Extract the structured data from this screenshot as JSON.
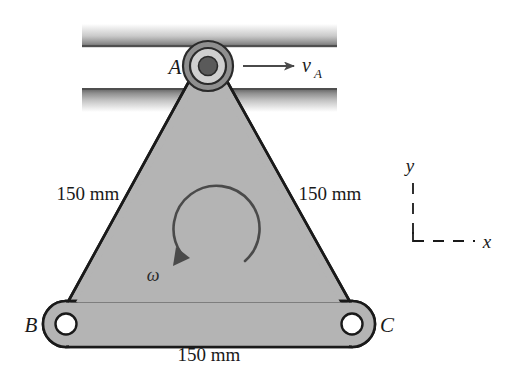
{
  "figure": {
    "points": {
      "a_label": "A",
      "b_label": "B",
      "c_label": "C"
    },
    "velocity": {
      "symbol": "v",
      "subscript": "A",
      "arrow_direction": "right"
    },
    "omega": {
      "symbol": "ω",
      "sense": "counterclockwise"
    },
    "dimensions": {
      "left_side": "150 mm",
      "right_side": "150 mm",
      "bottom_side": "150 mm"
    },
    "axes": {
      "y_label": "y",
      "x_label": "x",
      "style": "dashed"
    },
    "colors": {
      "plate_fill": "#b4b4b4",
      "plate_stroke": "#1a1a1a",
      "rail_dark": "#6e6e6e",
      "rail_light": "#ffffff",
      "pin_ring": "#a8a8a8",
      "pin_core": "#5a5a5a",
      "pin_hole": "#ffffff",
      "text": "#1a1a1a"
    }
  }
}
